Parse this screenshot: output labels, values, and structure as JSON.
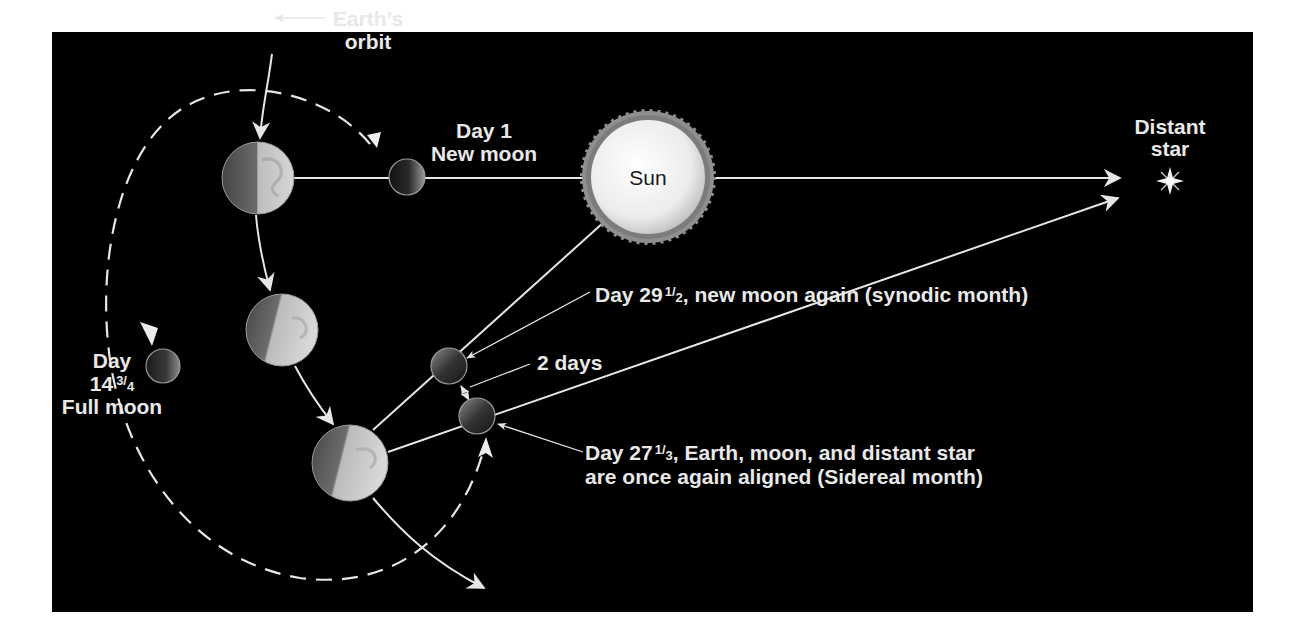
{
  "diagram": {
    "type": "lunar-month-diagram",
    "colors": {
      "page_background": "#ffffff",
      "panel_background": "#000000",
      "line": "#e6e6e6",
      "sun_core": "#f4f4f4",
      "sun_corona": "#8f8f8f",
      "earth_light": "#c9c9c9",
      "earth_dark": "#5a5a5a",
      "moon_dark": "#1c1c1c",
      "moon_light": "#8a8a8a"
    },
    "labels": {
      "earths_orbit_line1": "Earth’s",
      "earths_orbit_line2": "orbit",
      "day1_line1": "Day 1",
      "day1_line2": "New moon",
      "sun": "Sun",
      "distant_star_line1": "Distant",
      "distant_star_line2": "star",
      "synodic_prefix": "Day 29",
      "synodic_fraction_num": "1",
      "synodic_fraction_den": "2",
      "synodic_suffix": ", new moon again (synodic month)",
      "two_days": "2 days",
      "full_moon_line1": "Day",
      "full_moon_whole": "14",
      "full_moon_fraction_num": "3",
      "full_moon_fraction_den": "4",
      "full_moon_line3": "Full moon",
      "sidereal_prefix": "Day 27",
      "sidereal_fraction_num": "1",
      "sidereal_fraction_den": "3",
      "sidereal_suffix": ", Earth, moon, and distant star",
      "sidereal_line2": "are once again aligned (Sidereal month)"
    },
    "bodies": [
      {
        "name": "Earth",
        "position": "day 1",
        "cx": 258,
        "cy": 178,
        "r": 36
      },
      {
        "name": "Moon",
        "position": "day 1 new moon",
        "cx": 407,
        "cy": 177,
        "r": 18
      },
      {
        "name": "Sun",
        "cx": 648,
        "cy": 177,
        "r": 58
      },
      {
        "name": "Distant star",
        "cx": 1170,
        "cy": 181
      },
      {
        "name": "Earth",
        "position": "mid orbit",
        "cx": 282,
        "cy": 330,
        "r": 36
      },
      {
        "name": "Moon",
        "position": "day 14 3/4 full moon",
        "cx": 163,
        "cy": 366,
        "r": 17
      },
      {
        "name": "Earth",
        "position": "day 27-29",
        "cx": 350,
        "cy": 463,
        "r": 38
      },
      {
        "name": "Moon",
        "position": "day 29 1/2 synodic",
        "cx": 449,
        "cy": 366,
        "r": 18
      },
      {
        "name": "Moon",
        "position": "day 27 1/3 sidereal",
        "cx": 477,
        "cy": 416,
        "r": 18
      }
    ]
  }
}
